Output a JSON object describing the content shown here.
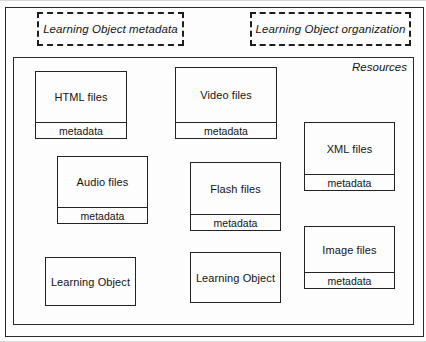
{
  "diagram": {
    "concept_boxes": [
      {
        "label": "Learning Object metadata",
        "style": "dashed"
      },
      {
        "label": "Learning Object organization",
        "style": "dashed"
      }
    ],
    "container": {
      "label": "Resources",
      "style": "solid"
    },
    "nodes": [
      {
        "label": "HTML files",
        "metadata_label": "metadata",
        "has_metadata": true
      },
      {
        "label": "Video files",
        "metadata_label": "metadata",
        "has_metadata": true
      },
      {
        "label": "XML files",
        "metadata_label": "metadata",
        "has_metadata": true
      },
      {
        "label": "Audio files",
        "metadata_label": "metadata",
        "has_metadata": true
      },
      {
        "label": "Flash files",
        "metadata_label": "metadata",
        "has_metadata": true
      },
      {
        "label": "Image files",
        "metadata_label": "metadata",
        "has_metadata": true
      },
      {
        "label": "Learning Object",
        "has_metadata": false
      },
      {
        "label": "Learning Object",
        "has_metadata": false
      }
    ],
    "colors": {
      "line": "#232323",
      "text": "#141414",
      "background": "#fdfdfd"
    }
  }
}
